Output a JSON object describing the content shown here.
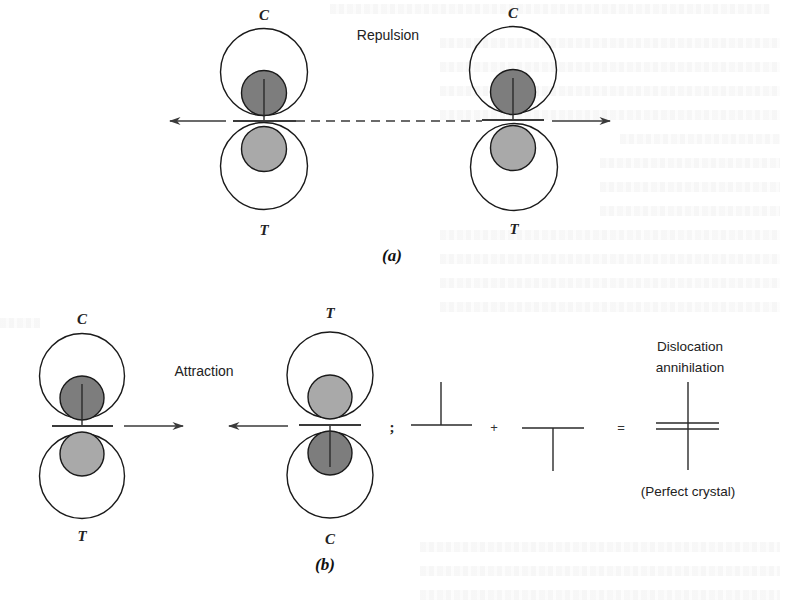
{
  "figure": {
    "panel_a": {
      "label": "(a)",
      "interaction_label": "Repulsion",
      "dislocations": [
        {
          "top_label": "C",
          "bottom_label": "T",
          "orientation": "positive-edge"
        },
        {
          "top_label": "C",
          "bottom_label": "T",
          "orientation": "positive-edge"
        }
      ]
    },
    "panel_b": {
      "label": "(b)",
      "interaction_label": "Attraction",
      "dislocations": [
        {
          "top_label": "C",
          "bottom_label": "T",
          "orientation": "positive-edge"
        },
        {
          "top_label": "T",
          "bottom_label": "C",
          "orientation": "negative-edge"
        }
      ],
      "separator": ";",
      "equation": {
        "plus": "+",
        "equals": "=",
        "result_title_line1": "Dislocation",
        "result_title_line2": "annihilation",
        "result_caption": "(Perfect crystal)"
      }
    },
    "colors": {
      "compression_fill": "#7d7d7d",
      "tension_fill": "#a9a9a9",
      "stroke": "#1a1a1a",
      "background": "#ffffff"
    }
  }
}
